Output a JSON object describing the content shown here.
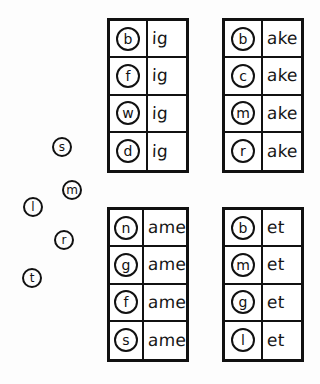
{
  "worksheet": {
    "background_color": "#ffffff",
    "ink_color": "#111111",
    "tables": [
      {
        "id": "ig",
        "rime": "ig",
        "rows": [
          {
            "onset": "b",
            "rime": "ig",
            "word": "big"
          },
          {
            "onset": "f",
            "rime": "ig",
            "word": "fig"
          },
          {
            "onset": "w",
            "rime": "ig",
            "word": "wig"
          },
          {
            "onset": "d",
            "rime": "ig",
            "word": "dig"
          }
        ]
      },
      {
        "id": "ake",
        "rime": "ake",
        "rows": [
          {
            "onset": "b",
            "rime": "ake",
            "word": "bake"
          },
          {
            "onset": "c",
            "rime": "ake",
            "word": "cake"
          },
          {
            "onset": "m",
            "rime": "ake",
            "word": "make"
          },
          {
            "onset": "r",
            "rime": "ake",
            "word": "rake"
          }
        ]
      },
      {
        "id": "ame",
        "rime": "ame",
        "rows": [
          {
            "onset": "n",
            "rime": "ame",
            "word": "name"
          },
          {
            "onset": "g",
            "rime": "ame",
            "word": "game"
          },
          {
            "onset": "f",
            "rime": "ame",
            "word": "fame"
          },
          {
            "onset": "s",
            "rime": "ame",
            "word": "same"
          }
        ]
      },
      {
        "id": "et",
        "rime": "et",
        "rows": [
          {
            "onset": "b",
            "rime": "et",
            "word": "bet"
          },
          {
            "onset": "m",
            "rime": "et",
            "word": "met"
          },
          {
            "onset": "g",
            "rime": "et",
            "word": "get"
          },
          {
            "onset": "l",
            "rime": "et",
            "word": "let"
          }
        ]
      }
    ],
    "loose_letters": [
      {
        "letter": "s",
        "x": 52,
        "y": 137
      },
      {
        "letter": "m",
        "x": 62,
        "y": 180
      },
      {
        "letter": "l",
        "x": 23,
        "y": 197
      },
      {
        "letter": "r",
        "x": 54,
        "y": 230
      },
      {
        "letter": "t",
        "x": 22,
        "y": 268
      }
    ]
  }
}
